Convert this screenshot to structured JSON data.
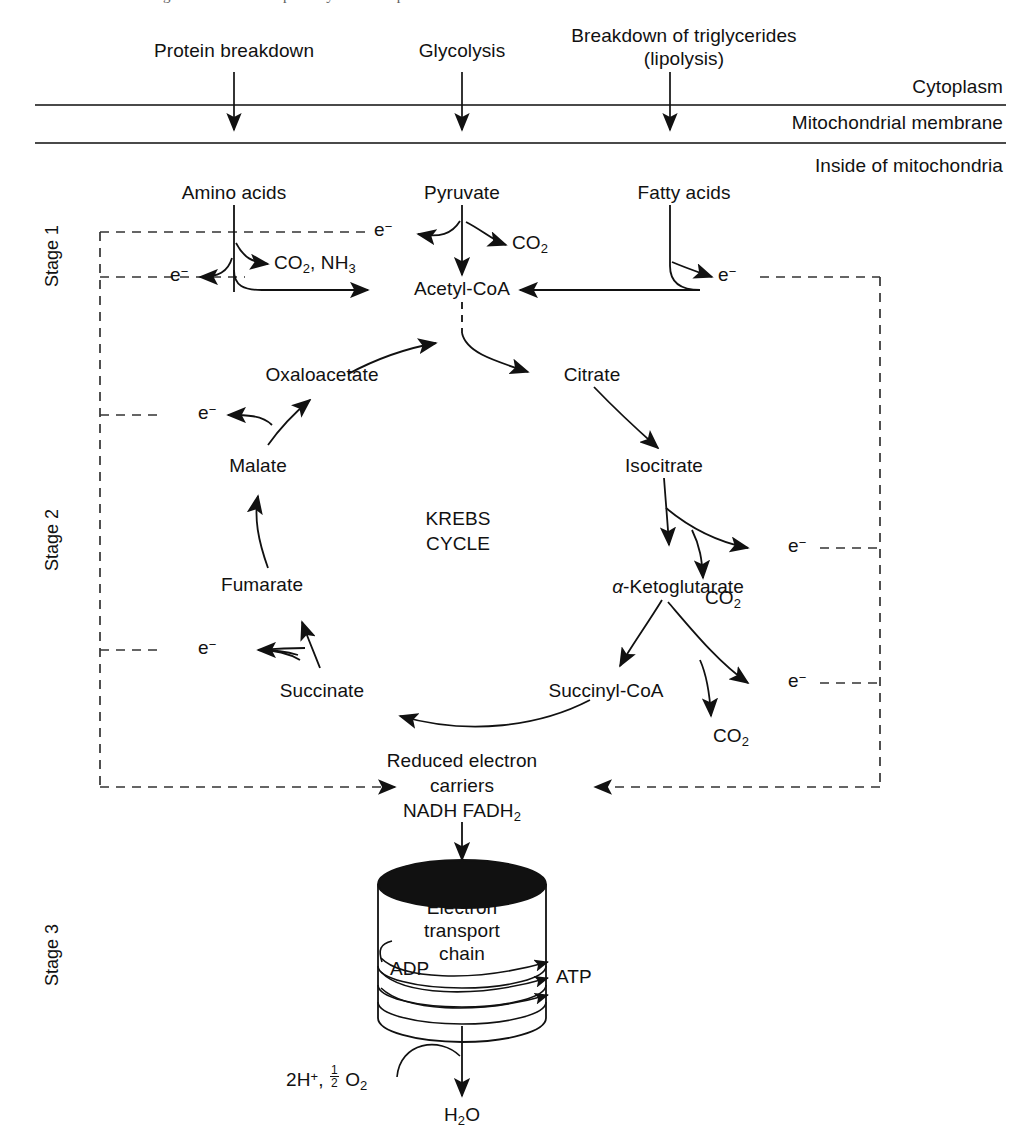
{
  "figure": {
    "caption_partial": "FIGURE  The three stages of the catabolic pathway of cell respiration."
  },
  "compartments": {
    "cytoplasm": "Cytoplasm",
    "membrane": "Mitochondrial membrane",
    "inside": "Inside of mitochondria"
  },
  "stages": [
    {
      "id": "stage-1",
      "label": "Stage 1"
    },
    {
      "id": "stage-2",
      "label": "Stage 2"
    },
    {
      "id": "stage-3",
      "label": "Stage 3"
    }
  ],
  "inputs": [
    {
      "id": "protein-breakdown",
      "label": "Protein breakdown",
      "x": 234
    },
    {
      "id": "glycolysis",
      "label": "Glycolysis",
      "x": 462
    },
    {
      "id": "lipolysis",
      "label_line1": "Breakdown of triglycerides",
      "label_line2": "(lipolysis)",
      "x": 670
    }
  ],
  "stage1": {
    "amino_acids": "Amino acids",
    "pyruvate": "Pyruvate",
    "fatty_acids": "Fatty acids",
    "acetyl_coa": "Acetyl-CoA",
    "co2_nh3": {
      "main1": "CO",
      "sub1": "2",
      "sep": ", NH",
      "sub2": "3"
    },
    "co2": {
      "main": "CO",
      "sub": "2"
    },
    "electron": {
      "main": "e",
      "sup": "−"
    }
  },
  "krebs": {
    "center_line1": "KREBS",
    "center_line2": "CYCLE",
    "intermediates": [
      {
        "id": "oxaloacetate",
        "label": "Oxaloacetate"
      },
      {
        "id": "citrate",
        "label": "Citrate"
      },
      {
        "id": "isocitrate",
        "label": "Isocitrate"
      },
      {
        "id": "alpha-ketoglutarate",
        "prefix": "α",
        "label": "-Ketoglutarate"
      },
      {
        "id": "succinyl-coa",
        "label": "Succinyl-CoA"
      },
      {
        "id": "succinate",
        "label": "Succinate"
      },
      {
        "id": "fumarate",
        "label": "Fumarate"
      },
      {
        "id": "malate",
        "label": "Malate"
      }
    ],
    "co2_label": {
      "main": "CO",
      "sub": "2"
    },
    "electron": {
      "main": "e",
      "sup": "−"
    }
  },
  "stage3": {
    "reduced_carriers_line1": "Reduced electron",
    "reduced_carriers_line2": "carriers",
    "nadh": "NADH",
    "fadh2": {
      "main": "FADH",
      "sub": "2"
    },
    "etc_line1": "Electron",
    "etc_line2": "transport",
    "etc_line3": "chain",
    "adp": "ADP",
    "atp": "ATP",
    "substrate": {
      "pre": "2H",
      "sup": "+",
      "comma": ", ",
      "num": "1",
      "den": "2",
      "o": "O",
      "osub": "2"
    },
    "water": {
      "main1": "H",
      "sub": "2",
      "main2": "O"
    }
  },
  "colors": {
    "ink": "#111111",
    "membrane_line": "#4a4a4a",
    "dashed": "#333333",
    "fill_dark": "#111111"
  }
}
